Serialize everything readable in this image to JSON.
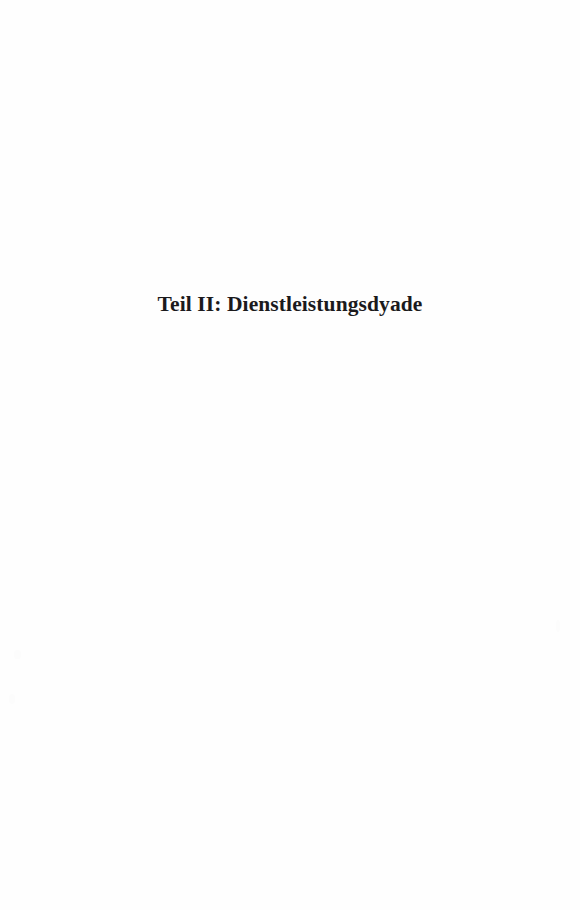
{
  "page": {
    "kind": "part-divider-page",
    "width": 580,
    "height": 910,
    "background_color": "#fefefe",
    "text_color": "#1b1a1c",
    "language": "de"
  },
  "content": {
    "part_title": "Teil II: Dienstleistungsdyade"
  },
  "header": {
    "running_head": ""
  },
  "footer": {
    "page_number": ""
  }
}
